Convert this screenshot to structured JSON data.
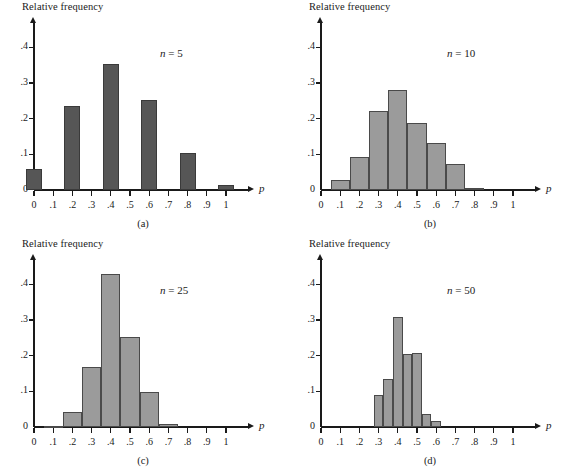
{
  "figure": {
    "y_axis_label": "Relative frequency",
    "x_axis_name": "p",
    "y_ticks": [
      "0",
      ".1",
      ".2",
      ".3",
      ".4"
    ],
    "x_ticks": [
      "0",
      ".1",
      ".2",
      ".3",
      ".4",
      ".5",
      ".6",
      ".7",
      ".8",
      ".9",
      "1"
    ],
    "colors": {
      "bar_dark": "#565656",
      "bar_light": "#9b9b9b",
      "outline": "#3a3a3a",
      "axis": "#1a1a1a"
    }
  },
  "panels": [
    {
      "id": "a",
      "caption": "(a)",
      "n_label_prefix": "n",
      "n_label_eq": "=",
      "n_label_value": "5"
    },
    {
      "id": "b",
      "caption": "(b)",
      "n_label_prefix": "n",
      "n_label_eq": "=",
      "n_label_value": "10"
    },
    {
      "id": "c",
      "caption": "(c)",
      "n_label_prefix": "n",
      "n_label_eq": "=",
      "n_label_value": "25"
    },
    {
      "id": "d",
      "caption": "(d)",
      "n_label_prefix": "n",
      "n_label_eq": "=",
      "n_label_value": "50"
    }
  ],
  "chart_data": [
    {
      "type": "bar",
      "panel": "a",
      "title": "n = 5",
      "xlabel": "p",
      "ylabel": "Relative frequency",
      "xlim": [
        0,
        1.05
      ],
      "ylim": [
        0,
        0.44
      ],
      "grid": false,
      "bar_width": 0.1,
      "bar_style": "separated",
      "fill": "#565656",
      "categories": [
        "0",
        ".2",
        ".4",
        ".6",
        ".8",
        "1"
      ],
      "x": [
        0.0,
        0.2,
        0.4,
        0.6,
        0.8,
        1.0
      ],
      "values": [
        0.06,
        0.236,
        0.353,
        0.253,
        0.104,
        0.013
      ]
    },
    {
      "type": "bar",
      "panel": "b",
      "title": "n = 10",
      "xlabel": "p",
      "ylabel": "Relative frequency",
      "xlim": [
        0,
        1.05
      ],
      "ylim": [
        0,
        0.44
      ],
      "grid": false,
      "bar_width": 0.1,
      "bar_style": "contiguous",
      "fill": "#9b9b9b",
      "categories": [
        ".1",
        ".2",
        ".3",
        ".4",
        ".5",
        ".6",
        ".7",
        ".8"
      ],
      "x": [
        0.1,
        0.2,
        0.3,
        0.4,
        0.5,
        0.6,
        0.7,
        0.8
      ],
      "values": [
        0.027,
        0.093,
        0.222,
        0.279,
        0.187,
        0.132,
        0.072,
        0.007
      ]
    },
    {
      "type": "bar",
      "panel": "c",
      "title": "n = 25",
      "xlabel": "p",
      "ylabel": "Relative frequency",
      "xlim": [
        0,
        1.05
      ],
      "ylim": [
        0,
        0.44
      ],
      "grid": false,
      "bar_width": 0.1,
      "bar_style": "contiguous",
      "fill": "#9b9b9b",
      "categories": [
        ".1",
        ".2",
        ".3",
        ".4",
        ".5",
        ".6",
        ".7"
      ],
      "x": [
        0.1,
        0.2,
        0.3,
        0.4,
        0.5,
        0.6,
        0.7
      ],
      "values": [
        0.004,
        0.042,
        0.169,
        0.428,
        0.251,
        0.097,
        0.008
      ]
    },
    {
      "type": "bar",
      "panel": "d",
      "title": "n = 50",
      "xlabel": "p",
      "ylabel": "Relative frequency",
      "xlim": [
        0,
        1.05
      ],
      "ylim": [
        0,
        0.44
      ],
      "grid": false,
      "bar_width": 0.05,
      "bar_style": "contiguous",
      "fill": "#9b9b9b",
      "categories": [
        ".30",
        ".35",
        ".40",
        ".45",
        ".50",
        ".55",
        ".60"
      ],
      "x": [
        0.3,
        0.35,
        0.4,
        0.45,
        0.5,
        0.55,
        0.6
      ],
      "values": [
        0.091,
        0.134,
        0.308,
        0.205,
        0.208,
        0.037,
        0.017
      ]
    }
  ]
}
